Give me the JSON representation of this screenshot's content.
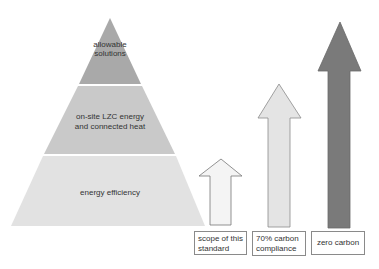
{
  "pyramid": {
    "layers": [
      {
        "label_lines": [
          "allowable",
          "solutions"
        ],
        "color": "#a9a9a9"
      },
      {
        "label_lines": [
          "on-site LZC energy",
          "and connected heat"
        ],
        "color": "#c9c9c9"
      },
      {
        "label_lines": [
          "energy efficiency"
        ],
        "color": "#e2e2e2"
      }
    ]
  },
  "arrows": [
    {
      "label": "scope of this standard",
      "label_lines": [
        "scope of this",
        "standard"
      ],
      "fill": "#f4f4f4",
      "stroke": "#777777"
    },
    {
      "label": "70% carbon compliance",
      "label_lines": [
        "70% carbon",
        "compliance"
      ],
      "fill": "#e4e4e4",
      "stroke": "#8a8a8a"
    },
    {
      "label": "zero carbon",
      "label_lines": [
        "zero carbon"
      ],
      "fill": "#7a7a7a",
      "stroke": "#6a6a6a"
    }
  ]
}
